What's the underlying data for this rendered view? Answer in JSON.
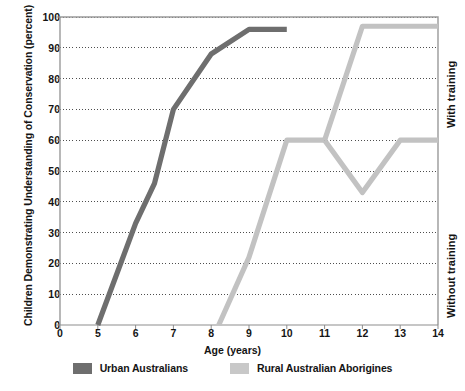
{
  "chart_data": {
    "type": "line",
    "title": "",
    "xlabel": "Age (years)",
    "ylabel": "Children Demonstrating Understanding of Conservation (percent)",
    "xlim": [
      0,
      14
    ],
    "ylim": [
      0,
      100
    ],
    "xticks": [
      "0",
      "5",
      "6",
      "7",
      "8",
      "9",
      "10",
      "11",
      "12",
      "13",
      "14"
    ],
    "xtick_values": [
      0,
      5,
      6,
      7,
      8,
      9,
      10,
      11,
      12,
      13,
      14
    ],
    "yticks": [
      "0",
      "10",
      "20",
      "30",
      "40",
      "50",
      "60",
      "70",
      "80",
      "90",
      "100"
    ],
    "ytick_values": [
      0,
      10,
      20,
      30,
      40,
      50,
      60,
      70,
      80,
      90,
      100
    ],
    "grid": "horizontal-dotted",
    "legend_position": "bottom",
    "series": [
      {
        "name": "Urban Australians",
        "color": "#6e6e6e",
        "points": [
          {
            "x": 5.0,
            "y": 0
          },
          {
            "x": 6.0,
            "y": 33
          },
          {
            "x": 6.5,
            "y": 46
          },
          {
            "x": 7.0,
            "y": 70
          },
          {
            "x": 8.0,
            "y": 88
          },
          {
            "x": 9.0,
            "y": 96
          },
          {
            "x": 10.0,
            "y": 96
          }
        ]
      },
      {
        "name": "Rural Australian Aborigines",
        "color": "#c2c2c2",
        "points": [
          {
            "x": 8.2,
            "y": 0
          },
          {
            "x": 9.0,
            "y": 22
          },
          {
            "x": 10.0,
            "y": 60
          },
          {
            "x": 11.0,
            "y": 60
          }
        ],
        "branches": [
          {
            "name": "With training",
            "points": [
              {
                "x": 11.0,
                "y": 60
              },
              {
                "x": 12.0,
                "y": 97
              },
              {
                "x": 14.0,
                "y": 97
              }
            ]
          },
          {
            "name": "Without training",
            "points": [
              {
                "x": 11.0,
                "y": 60
              },
              {
                "x": 12.0,
                "y": 43
              },
              {
                "x": 13.0,
                "y": 60
              },
              {
                "x": 14.0,
                "y": 60
              }
            ]
          }
        ]
      }
    ],
    "annotations": [
      {
        "text": "With training",
        "position": "right-upper",
        "rotation": -90
      },
      {
        "text": "Without training",
        "position": "right-lower",
        "rotation": -90
      }
    ]
  },
  "legend": {
    "items": [
      {
        "label": "Urban Australians",
        "color": "#6e6e6e"
      },
      {
        "label": "Rural Australian Aborigines",
        "color": "#c8c8c8"
      }
    ]
  },
  "axes": {
    "x_title": "Age (years)",
    "y_title": "Children Demonstrating Understanding of Conservation (percent)"
  },
  "side_labels": {
    "with_training": "With training",
    "without_training": "Without training"
  }
}
